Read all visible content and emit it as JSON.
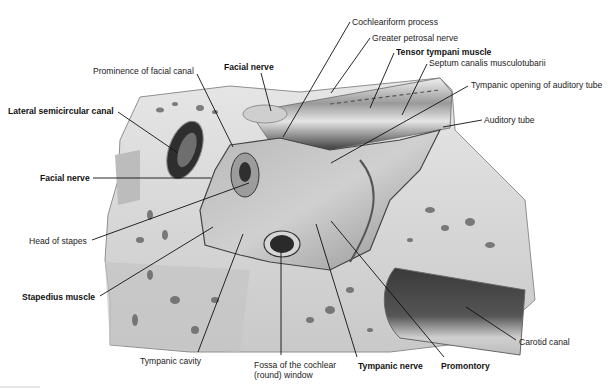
{
  "figure": {
    "type": "anatomical-illustration",
    "style": "grayscale"
  },
  "labels": [
    {
      "id": "cochleariform-process",
      "text": "Cochleariform process",
      "bold": false,
      "x": 352,
      "y": 17,
      "line": [
        [
          350,
          22
        ],
        [
          283,
          137
        ]
      ]
    },
    {
      "id": "greater-petrosal-nerve",
      "text": "Greater petrosal nerve",
      "bold": false,
      "x": 372,
      "y": 33,
      "line": [
        [
          370,
          38
        ],
        [
          331,
          93
        ]
      ]
    },
    {
      "id": "tensor-tympani-muscle",
      "text": "Tensor tympani muscle",
      "bold": true,
      "x": 396,
      "y": 47,
      "line": [
        [
          394,
          53
        ],
        [
          370,
          108
        ]
      ]
    },
    {
      "id": "septum-canalis-musculotubarii",
      "text": "Septum canalis musculotubarii",
      "bold": false,
      "x": 429,
      "y": 58,
      "line": [
        [
          427,
          64
        ],
        [
          402,
          115
        ]
      ]
    },
    {
      "id": "facial-nerve-top",
      "text": "Facial nerve",
      "bold": true,
      "x": 224,
      "y": 62,
      "line": [
        [
          261,
          73
        ],
        [
          271,
          111
        ]
      ]
    },
    {
      "id": "prominence-of-facial-canal",
      "text": "Prominence of facial canal",
      "bold": false,
      "x": 93,
      "y": 66,
      "line": [
        [
          197,
          74
        ],
        [
          233,
          147
        ]
      ]
    },
    {
      "id": "tympanic-opening-of-auditory-tube",
      "text": "Tympanic opening of auditory tube",
      "bold": false,
      "x": 471,
      "y": 80,
      "line": [
        [
          468,
          86
        ],
        [
          331,
          163
        ]
      ]
    },
    {
      "id": "lateral-semicircular-canal",
      "text": "Lateral semicircular canal",
      "bold": true,
      "x": 8,
      "y": 106,
      "line": [
        [
          118,
          112
        ],
        [
          178,
          153
        ]
      ]
    },
    {
      "id": "auditory-tube",
      "text": "Auditory tube",
      "bold": false,
      "x": 484,
      "y": 115,
      "line": [
        [
          482,
          120
        ],
        [
          443,
          127
        ]
      ]
    },
    {
      "id": "facial-nerve-left",
      "text": "Facial nerve",
      "bold": true,
      "x": 40,
      "y": 173,
      "line": [
        [
          93,
          178
        ],
        [
          211,
          178
        ]
      ]
    },
    {
      "id": "head-of-stapes",
      "text": "Head of stapes",
      "bold": false,
      "x": 29,
      "y": 236,
      "line": [
        [
          92,
          240
        ],
        [
          249,
          183
        ]
      ]
    },
    {
      "id": "stapedius-muscle",
      "text": "Stapedius muscle",
      "bold": true,
      "x": 22,
      "y": 292,
      "line": [
        [
          100,
          296
        ],
        [
          213,
          227
        ]
      ]
    },
    {
      "id": "carotid-canal",
      "text": "Carotid canal",
      "bold": false,
      "x": 519,
      "y": 337,
      "line": [
        [
          516,
          340
        ],
        [
          466,
          307
        ]
      ]
    },
    {
      "id": "tympanic-cavity",
      "text": "Tympanic cavity",
      "bold": false,
      "x": 140,
      "y": 356,
      "line": [
        [
          198,
          352
        ],
        [
          243,
          234
        ]
      ]
    },
    {
      "id": "fossa-of-cochlear-window",
      "text": "Fossa of the cochlear",
      "text2": "(round) window",
      "bold": false,
      "x": 254,
      "y": 360,
      "line": [
        [
          281,
          355
        ],
        [
          281,
          252
        ]
      ]
    },
    {
      "id": "tympanic-nerve",
      "text": "Tympanic nerve",
      "bold": true,
      "x": 358,
      "y": 361,
      "line": [
        [
          357,
          357
        ],
        [
          316,
          224
        ]
      ]
    },
    {
      "id": "promontory",
      "text": "Promontory",
      "bold": true,
      "x": 441,
      "y": 361,
      "line": [
        [
          444,
          357
        ],
        [
          331,
          221
        ]
      ]
    }
  ],
  "colors": {
    "bone_light": "#d9d9d9",
    "bone_mid": "#bdbdbd",
    "bone_dark": "#8a8a8a",
    "cavity": "#a6a6a6",
    "shadow": "#4a4a4a",
    "line": "#111111"
  }
}
